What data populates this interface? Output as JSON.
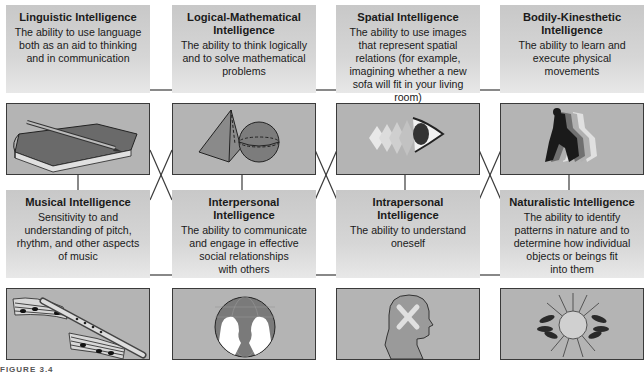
{
  "diagram": {
    "type": "multiple-intelligences-grid",
    "layout": {
      "rows": 2,
      "columns": 4
    },
    "colors": {
      "panel_fill": "#c8c8c8",
      "image_fill": "#b4b4b4",
      "border": "#3a3a3a",
      "connector": "#3a3a3a"
    },
    "cards": [
      {
        "title": "Linguistic Intelligence",
        "description": "The ability to use language\nboth as an aid to thinking\nand in communication",
        "icon": "book-and-pencil-icon"
      },
      {
        "title": "Logical-Mathematical\nIntelligence",
        "description": "The ability to think logically\nand to solve mathematical\nproblems",
        "icon": "pyramid-and-sphere-icon"
      },
      {
        "title": "Spatial Intelligence",
        "description": "The ability to use images\nthat represent spatial\nrelations (for example,\nimagining whether a new\nsofa will fit in your living room)",
        "icon": "eye-icon"
      },
      {
        "title": "Bodily-Kinesthetic\nIntelligence",
        "description": "The ability to learn and\nexecute physical\nmovements",
        "icon": "runner-icon"
      },
      {
        "title": "Musical Intelligence",
        "description": "Sensitivity to and\nunderstanding of pitch,\nrhythm, and other aspects\nof music",
        "icon": "recorder-and-sheet-music-icon"
      },
      {
        "title": "Interpersonal\nIntelligence",
        "description": "The ability to communicate\nand engage in effective\nsocial relationships\nwith others",
        "icon": "globe-with-faces-icon"
      },
      {
        "title": "Intrapersonal\nIntelligence",
        "description": "The ability to understand\noneself",
        "icon": "head-silhouette-icon"
      },
      {
        "title": "Naturalistic Intelligence",
        "description": "The ability to identify\npatterns in nature and to\ndetermine how individual\nobjects or beings fit\ninto them",
        "icon": "sun-with-leaves-icon"
      }
    ],
    "figure_label": "FIGURE 3.4"
  }
}
